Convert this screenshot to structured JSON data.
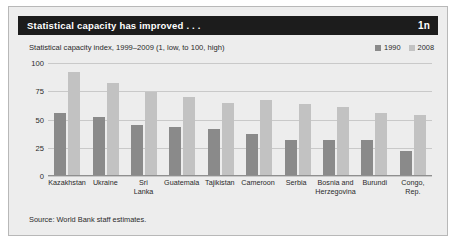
{
  "figure": {
    "title": "Statistical capacity has improved . . .",
    "number": "1n",
    "source": "Source: World Bank staff estimates."
  },
  "colors": {
    "header_background": "#1c1c1c",
    "panel_background": "#ededed",
    "series_1990": "#8a8a8a",
    "series_2008": "#c2c2c2",
    "gridline": "#c9c9c9"
  },
  "chart_data": {
    "type": "bar",
    "title": "Statistical capacity has improved . . .",
    "subtitle": "Statistical capacity index, 1999–2009 (1, low, to 100, high)",
    "xlabel": "",
    "ylabel": "",
    "ylim": [
      0,
      100
    ],
    "yticks": [
      0,
      25,
      50,
      75,
      100
    ],
    "ytick_labels": [
      "0",
      "25",
      "50",
      "75",
      "100"
    ],
    "grid": true,
    "legend_position": "top-right",
    "categories": [
      "Kazakhstan",
      "Ukraine",
      "Sri\nLanka",
      "Guatemala",
      "Tajikistan",
      "Cameroon",
      "Serbia",
      "Bosnia and\nHerzegovina",
      "Burundi",
      "Congo,\nRep."
    ],
    "series": [
      {
        "name": "1990",
        "color": "#8a8a8a",
        "values": [
          56,
          52,
          45,
          43,
          42,
          37,
          32,
          32,
          32,
          22
        ]
      },
      {
        "name": "2008",
        "color": "#c2c2c2",
        "values": [
          92,
          82,
          74,
          70,
          65,
          67,
          64,
          61,
          56,
          54
        ]
      }
    ]
  }
}
